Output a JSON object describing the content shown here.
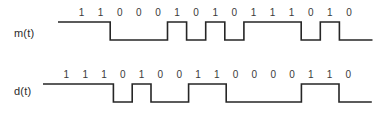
{
  "figure": {
    "background_color": "#ffffff",
    "line_color": "#262626",
    "text_color": "#3a3a3a"
  },
  "signals": [
    {
      "id": "m",
      "label": "m(t)",
      "bits": [
        "1",
        "1",
        "0",
        "0",
        "0",
        "1",
        "0",
        "1",
        "0",
        "1",
        "1",
        "1",
        "0",
        "1",
        "0"
      ],
      "geometry": {
        "x_start": 72,
        "bit_width": 19.1,
        "y_high": 22,
        "y_low": 40,
        "lead_in": 0,
        "labels_y": 6
      }
    },
    {
      "id": "d",
      "label": "d(t)",
      "bits": [
        "1",
        "1",
        "1",
        "0",
        "1",
        "0",
        "0",
        "1",
        "1",
        "0",
        "0",
        "0",
        "0",
        "1",
        "1",
        "0"
      ],
      "geometry": {
        "x_start": 57,
        "bit_width": 18.8,
        "y_high": 26,
        "y_low": 44,
        "lead_in": 0,
        "labels_y": 10
      }
    }
  ],
  "chart_data": {
    "type": "line",
    "title": "",
    "xlabel": "",
    "ylabel": "",
    "grid": false,
    "legend": "none",
    "series": [
      {
        "name": "m(t)",
        "categories": [
          "1",
          "2",
          "3",
          "4",
          "5",
          "6",
          "7",
          "8",
          "9",
          "10",
          "11",
          "12",
          "13",
          "14",
          "15"
        ],
        "values": [
          1,
          1,
          0,
          0,
          0,
          1,
          0,
          1,
          0,
          1,
          1,
          1,
          0,
          1,
          0
        ],
        "ylim": [
          0,
          1
        ]
      },
      {
        "name": "d(t)",
        "categories": [
          "1",
          "2",
          "3",
          "4",
          "5",
          "6",
          "7",
          "8",
          "9",
          "10",
          "11",
          "12",
          "13",
          "14",
          "15",
          "16"
        ],
        "values": [
          1,
          1,
          1,
          0,
          1,
          0,
          0,
          1,
          1,
          0,
          0,
          0,
          0,
          1,
          1,
          0
        ],
        "ylim": [
          0,
          1
        ]
      }
    ]
  }
}
